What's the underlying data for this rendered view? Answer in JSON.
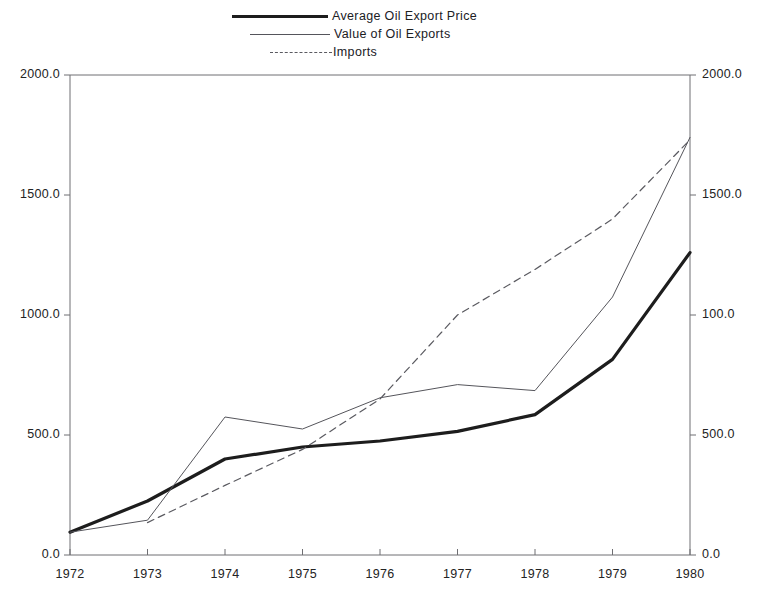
{
  "chart_data": {
    "type": "line",
    "title": "",
    "xlabel": "",
    "ylabel": "",
    "categories": [
      "1972",
      "1973",
      "1974",
      "1975",
      "1976",
      "1977",
      "1978",
      "1979",
      "1980"
    ],
    "x": [
      1972,
      1973,
      1974,
      1975,
      1976,
      1977,
      1978,
      1979,
      1980
    ],
    "ylim": [
      0,
      2000
    ],
    "xlim": [
      1972,
      1980
    ],
    "grid": false,
    "legend_position": "top-center",
    "dual_axis": true,
    "series": [
      {
        "name": "Average Oil Export Price",
        "style": "solid-bold",
        "color": "#1d1d1d",
        "x": [
          1972,
          1973,
          1974,
          1975,
          1976,
          1977,
          1978,
          1979,
          1980
        ],
        "values": [
          95,
          225,
          400,
          450,
          475,
          515,
          585,
          815,
          1260
        ]
      },
      {
        "name": "Value of Oil Exports",
        "style": "solid-thin",
        "color": "#55555b",
        "x": [
          1972,
          1973,
          1974,
          1975,
          1976,
          1977,
          1978,
          1979,
          1980
        ],
        "values": [
          95,
          145,
          575,
          525,
          655,
          710,
          685,
          1075,
          1740
        ]
      },
      {
        "name": "Imports",
        "style": "dashed",
        "color": "#5a5a60",
        "x": [
          1973,
          1974,
          1975,
          1976,
          1977,
          1978,
          1979,
          1980
        ],
        "values": [
          135,
          290,
          440,
          650,
          1000,
          1190,
          1400,
          1730
        ]
      }
    ],
    "axis_left": {
      "ticks": [
        0,
        500,
        1000,
        1500,
        2000
      ],
      "tick_labels": [
        "0.0",
        "500.0",
        "1000.0",
        "1500.0",
        "2000.0"
      ]
    },
    "axis_right": {
      "ticks": [
        0,
        500,
        1000,
        1500,
        2000
      ],
      "tick_labels": [
        "0.0",
        "500.0",
        "100.0",
        "1500.0",
        "2000.0"
      ]
    },
    "axis_bottom": {
      "tick_labels": [
        "1972",
        "1973",
        "1974",
        "1975",
        "1976",
        "1977",
        "1978",
        "1979",
        "1980"
      ]
    }
  },
  "legend": {
    "items": [
      {
        "label": "Average Oil Export Price",
        "style": "solid-bold"
      },
      {
        "label": "Value of Oil Exports",
        "style": "solid-thin"
      },
      {
        "label": "Imports",
        "style": "dashed"
      }
    ]
  }
}
